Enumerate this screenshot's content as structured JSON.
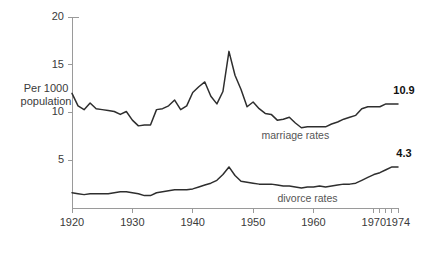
{
  "chart_data": {
    "type": "line",
    "title": "",
    "subtitle": "",
    "xlabel": "",
    "ylabel": "Per 1000 population",
    "xlim": [
      1920,
      1974
    ],
    "ylim": [
      0,
      20
    ],
    "grid": false,
    "legend_position": "inline-on-curve",
    "y_ticks": [
      5,
      10,
      15,
      20
    ],
    "y_tick_labels": [
      "5",
      "10",
      "15",
      "20"
    ],
    "x_ticks": [
      1920,
      1930,
      1940,
      1950,
      1960,
      1970
    ],
    "x_tick_labels": [
      "1920",
      "1930",
      "1940",
      "1950",
      "1960",
      "1970"
    ],
    "x_minor_ticks": [
      1971,
      1972,
      1973,
      1974
    ],
    "x_end_label": "1974",
    "x": [
      1920,
      1921,
      1922,
      1923,
      1924,
      1925,
      1926,
      1927,
      1928,
      1929,
      1930,
      1931,
      1932,
      1933,
      1934,
      1935,
      1936,
      1937,
      1938,
      1939,
      1940,
      1941,
      1942,
      1943,
      1944,
      1945,
      1946,
      1947,
      1948,
      1949,
      1950,
      1951,
      1952,
      1953,
      1954,
      1955,
      1956,
      1957,
      1958,
      1959,
      1960,
      1961,
      1962,
      1963,
      1964,
      1965,
      1966,
      1967,
      1968,
      1969,
      1970,
      1971,
      1972,
      1973,
      1974
    ],
    "series": [
      {
        "name": "marriage rates",
        "label": "marriage rates",
        "end_value": 10.9,
        "end_value_label": "10.9",
        "color": "#2e2e2e",
        "values": [
          12.0,
          10.7,
          10.3,
          11.0,
          10.4,
          10.3,
          10.2,
          10.1,
          9.8,
          10.1,
          9.2,
          8.6,
          8.7,
          8.7,
          10.3,
          10.4,
          10.7,
          11.3,
          10.3,
          10.7,
          12.1,
          12.7,
          13.2,
          11.7,
          10.9,
          12.2,
          16.4,
          13.9,
          12.4,
          10.6,
          11.1,
          10.4,
          9.9,
          9.8,
          9.2,
          9.3,
          9.5,
          8.9,
          8.4,
          8.5,
          8.5,
          8.5,
          8.5,
          8.8,
          9.0,
          9.3,
          9.5,
          9.7,
          10.4,
          10.6,
          10.6,
          10.6,
          10.9,
          10.9,
          10.9
        ]
      },
      {
        "name": "divorce rates",
        "label": "divorce rates",
        "end_value": 4.3,
        "end_value_label": "4.3",
        "color": "#2e2e2e",
        "values": [
          1.6,
          1.5,
          1.4,
          1.5,
          1.5,
          1.5,
          1.5,
          1.6,
          1.7,
          1.7,
          1.6,
          1.5,
          1.3,
          1.3,
          1.6,
          1.7,
          1.8,
          1.9,
          1.9,
          1.9,
          2.0,
          2.2,
          2.4,
          2.6,
          2.9,
          3.5,
          4.3,
          3.4,
          2.8,
          2.7,
          2.6,
          2.5,
          2.5,
          2.5,
          2.4,
          2.3,
          2.3,
          2.2,
          2.1,
          2.2,
          2.2,
          2.3,
          2.2,
          2.3,
          2.4,
          2.5,
          2.5,
          2.6,
          2.9,
          3.2,
          3.5,
          3.7,
          4.0,
          4.3,
          4.3
        ]
      }
    ]
  },
  "labels": {
    "y_axis_title_line1": "Per 1000",
    "y_axis_title_line2": "population"
  }
}
